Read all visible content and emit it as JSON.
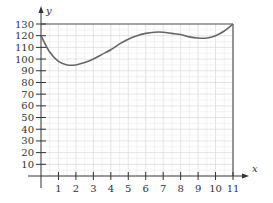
{
  "chart_data": {
    "type": "line",
    "title": "",
    "xlabel": "x",
    "ylabel": "y",
    "xlim": [
      0,
      11
    ],
    "ylim": [
      0,
      130
    ],
    "grid": true,
    "x_ticks": [
      1,
      2,
      3,
      4,
      5,
      6,
      7,
      8,
      9,
      10,
      11
    ],
    "y_ticks": [
      10,
      20,
      30,
      40,
      50,
      60,
      70,
      80,
      90,
      100,
      110,
      120,
      130
    ],
    "reference_lines": [
      {
        "type": "horizontal",
        "y": 130
      },
      {
        "type": "vertical",
        "x": 11
      }
    ],
    "series": [
      {
        "name": "curve",
        "x": [
          0,
          0.5,
          1,
          1.5,
          2,
          2.5,
          3,
          3.5,
          4,
          4.5,
          5,
          5.5,
          6,
          6.5,
          7,
          7.5,
          8,
          8.5,
          9,
          9.5,
          10,
          10.5,
          11
        ],
        "y": [
          120,
          106,
          98,
          95,
          95,
          97,
          100,
          104,
          108,
          113,
          117,
          120,
          122,
          123,
          123,
          122,
          121,
          119,
          118,
          118,
          120,
          124,
          130
        ]
      }
    ],
    "color": "#666666"
  }
}
